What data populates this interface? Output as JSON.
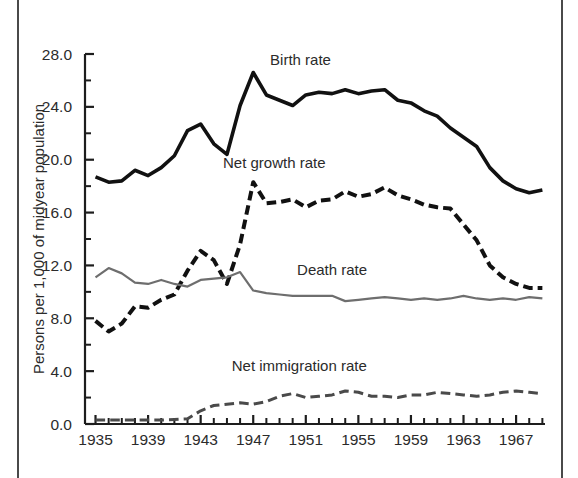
{
  "figure": {
    "background_color": "#ffffff",
    "frame_color": "#4a4a4a"
  },
  "chart_data": {
    "type": "line",
    "title": "",
    "subtitle": "",
    "xlabel": "",
    "ylabel": "Persons per 1,000 of midyear population",
    "xlim": [
      1934.2,
      1969.2
    ],
    "ylim": [
      0.0,
      28.0
    ],
    "grid": false,
    "legend_position": "inline-annotations",
    "y_ticks_major": [
      "0.0",
      "4.0",
      "8.0",
      "12.0",
      "16.0",
      "20.0",
      "24.0",
      "28.0"
    ],
    "y_tick_values": [
      0.0,
      4.0,
      8.0,
      12.0,
      16.0,
      20.0,
      24.0,
      28.0
    ],
    "y_minor_tick_values": [
      2.0,
      6.0,
      10.0,
      14.0,
      18.0,
      22.0,
      26.0
    ],
    "x_tick_labels": [
      "1935",
      "1939",
      "1943",
      "1947",
      "1951",
      "1955",
      "1959",
      "1963",
      "1967"
    ],
    "x_tick_values": [
      1935,
      1939,
      1943,
      1947,
      1951,
      1955,
      1959,
      1963,
      1967
    ],
    "x_minor_tick_values": [
      1936,
      1937,
      1938,
      1940,
      1941,
      1942,
      1944,
      1945,
      1946,
      1948,
      1949,
      1950,
      1952,
      1953,
      1954,
      1956,
      1957,
      1958,
      1960,
      1961,
      1962,
      1964,
      1965,
      1966,
      1968,
      1969
    ],
    "x": [
      1935,
      1936,
      1937,
      1938,
      1939,
      1940,
      1941,
      1942,
      1943,
      1944,
      1945,
      1946,
      1947,
      1948,
      1949,
      1950,
      1951,
      1952,
      1953,
      1954,
      1955,
      1956,
      1957,
      1958,
      1959,
      1960,
      1961,
      1962,
      1963,
      1964,
      1965,
      1966,
      1967,
      1968,
      1969
    ],
    "series": [
      {
        "name": "Birth rate",
        "label": "Birth rate",
        "color": "#111111",
        "style": "solid",
        "width": 3.6,
        "label_x": 1950.6,
        "label_y": 27.2,
        "values": [
          18.7,
          18.3,
          18.4,
          19.2,
          18.8,
          19.4,
          20.3,
          22.2,
          22.7,
          21.2,
          20.4,
          24.1,
          26.6,
          24.9,
          24.5,
          24.1,
          24.9,
          25.1,
          25.0,
          25.3,
          25.0,
          25.2,
          25.3,
          24.5,
          24.3,
          23.7,
          23.3,
          22.4,
          21.7,
          21.0,
          19.4,
          18.4,
          17.8,
          17.5,
          17.7
        ]
      },
      {
        "name": "Net growth rate",
        "label": "Net growth rate",
        "color": "#111111",
        "style": "dashed-heavy",
        "width": 4.0,
        "label_x": 1948.6,
        "label_y": 19.4,
        "values": [
          7.8,
          7.0,
          7.6,
          8.9,
          8.8,
          9.4,
          9.8,
          11.6,
          13.1,
          12.4,
          10.6,
          13.6,
          18.3,
          16.7,
          16.8,
          17.0,
          16.4,
          16.9,
          17.0,
          17.6,
          17.2,
          17.4,
          17.9,
          17.3,
          17.0,
          16.6,
          16.4,
          16.3,
          15.1,
          13.9,
          12.0,
          11.1,
          10.6,
          10.3,
          10.3
        ]
      },
      {
        "name": "Death rate",
        "label": "Death rate",
        "color": "#6e6e6e",
        "style": "solid",
        "width": 2.2,
        "label_x": 1953.0,
        "label_y": 11.3,
        "values": [
          11.1,
          11.8,
          11.4,
          10.7,
          10.6,
          10.9,
          10.6,
          10.4,
          10.9,
          11.0,
          11.1,
          11.5,
          10.1,
          9.9,
          9.8,
          9.7,
          9.7,
          9.7,
          9.7,
          9.3,
          9.4,
          9.5,
          9.6,
          9.5,
          9.4,
          9.5,
          9.4,
          9.5,
          9.7,
          9.5,
          9.4,
          9.5,
          9.4,
          9.6,
          9.5
        ]
      },
      {
        "name": "Net immigration rate",
        "label": "Net immigration rate",
        "color": "#4a4a4a",
        "style": "dashed-light",
        "width": 3.0,
        "label_x": 1950.5,
        "label_y": 4.0,
        "values": [
          0.3,
          0.3,
          0.3,
          0.3,
          0.3,
          0.3,
          0.35,
          0.4,
          1.0,
          1.4,
          1.5,
          1.6,
          1.5,
          1.7,
          2.1,
          2.3,
          2.0,
          2.1,
          2.2,
          2.5,
          2.4,
          2.1,
          2.1,
          2.0,
          2.2,
          2.2,
          2.4,
          2.3,
          2.2,
          2.1,
          2.2,
          2.4,
          2.5,
          2.4,
          2.3
        ]
      }
    ]
  }
}
